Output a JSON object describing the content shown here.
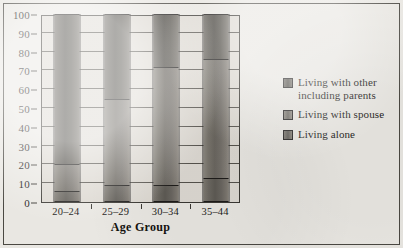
{
  "chart_data": {
    "type": "bar",
    "subtype": "stacked-column-100pct",
    "title": "",
    "xlabel": "Age Group",
    "ylabel": "",
    "ylim": [
      0,
      100
    ],
    "yticks": [
      0,
      10,
      20,
      30,
      40,
      50,
      60,
      70,
      80,
      90,
      100
    ],
    "ytick_labels": [
      "0",
      "10",
      "20",
      "30",
      "40",
      "50",
      "60",
      "70",
      "80",
      "90",
      "100"
    ],
    "grid": true,
    "grid_axis": "y",
    "legend_position": "right",
    "categories": [
      "20–24",
      "25–29",
      "30–34",
      "35–44"
    ],
    "series": [
      {
        "name": "Living alone",
        "values": [
          6,
          9,
          9,
          13
        ],
        "color": "#6c6861",
        "stack_order": 1
      },
      {
        "name": "Living with spouse",
        "values": [
          14,
          46,
          63,
          63
        ],
        "color": "#79756d",
        "stack_order": 2
      },
      {
        "name": "Living with other including parents",
        "values": [
          80,
          45,
          28,
          24
        ],
        "color": "#5b5851",
        "stack_order": 3
      }
    ],
    "cumulative_boundaries": {
      "20–24": [
        6,
        20
      ],
      "25–29": [
        9,
        55
      ],
      "30–34": [
        9,
        72
      ],
      "35–44": [
        13,
        76
      ]
    }
  },
  "legend": {
    "items": [
      {
        "label_line1": "Living with other",
        "label_line2": "including parents",
        "swatch": "sw-top"
      },
      {
        "label_line1": "Living with spouse",
        "label_line2": "",
        "swatch": "sw-mid"
      },
      {
        "label_line1": "Living alone",
        "label_line2": "",
        "swatch": "sw-bot"
      }
    ]
  },
  "axis": {
    "x_title": "Age Group"
  },
  "colors": {
    "background": "#e9e7e2",
    "plot_background": "#ddd9d2",
    "frame": "#4a4842",
    "gridline": "#55524c",
    "text": "#1d1b19"
  }
}
